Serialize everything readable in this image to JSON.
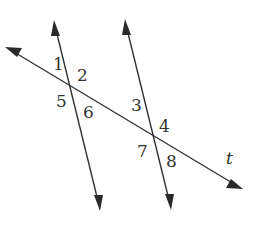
{
  "diagram": {
    "type": "parallel-lines-cut-by-transversal",
    "transversal": {
      "label": "t",
      "from": [
        5,
        47
      ],
      "to": [
        243,
        189
      ]
    },
    "lines": [
      {
        "name": "line-a",
        "from": [
          54,
          20
        ],
        "to": [
          100,
          211
        ]
      },
      {
        "name": "line-b",
        "from": [
          125,
          19
        ],
        "to": [
          171,
          210
        ]
      }
    ],
    "intersections": [
      [
        71,
        86
      ],
      [
        154,
        136
      ]
    ],
    "angle_labels": [
      "1",
      "2",
      "3",
      "4",
      "5",
      "6",
      "7",
      "8"
    ],
    "colors": {
      "stroke": "#333333",
      "background": "#ffffff"
    }
  }
}
